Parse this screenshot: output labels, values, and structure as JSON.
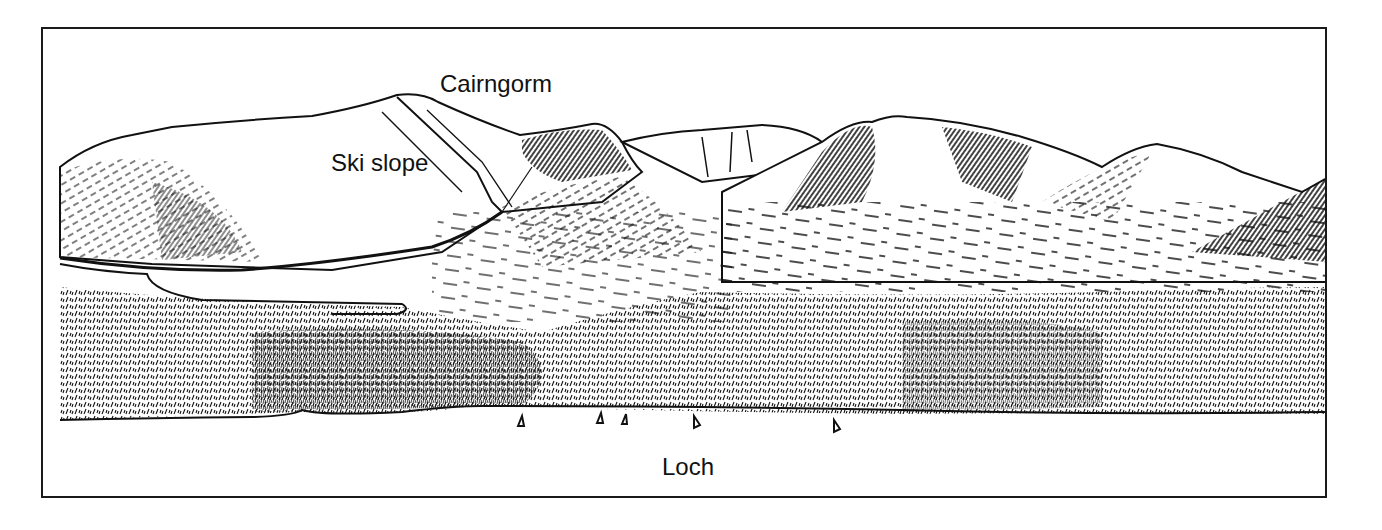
{
  "figure": {
    "labels": {
      "peak": "Cairngorm",
      "ski_slope": "Ski slope",
      "loch": "Loch"
    },
    "colors": {
      "ink": "#111111",
      "paper": "#ffffff",
      "border": "#1a1a1a"
    },
    "boats": 5
  }
}
